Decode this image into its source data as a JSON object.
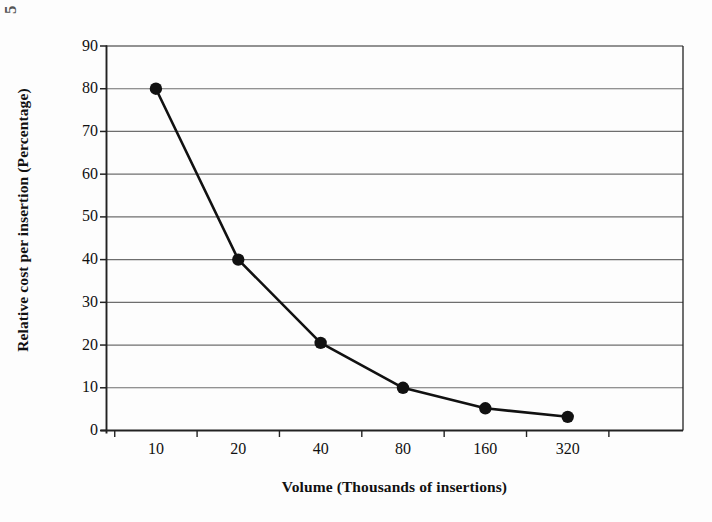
{
  "figure": {
    "background_color": "#fdfdfd",
    "line_color": "#1a1a1a",
    "marker_color": "#111111",
    "grid_color": "#6e6e6e",
    "axis_color": "#222222",
    "artifact_text": "5"
  },
  "chart_data": {
    "type": "line",
    "title": "",
    "xlabel": "Volume (Thousands of insertions)",
    "ylabel": "Relative cost per insertion (Percentage)",
    "categories": [
      "10",
      "20",
      "40",
      "80",
      "160",
      "320"
    ],
    "values": [
      80,
      40,
      20.5,
      10,
      5.2,
      3.2
    ],
    "series": [
      {
        "name": "Relative cost per insertion",
        "values": [
          80,
          40,
          20.5,
          10,
          5.2,
          3.2
        ],
        "marker": "filled-circle",
        "color": "#111111"
      }
    ],
    "ylim": [
      0,
      90
    ],
    "ytick_step": 10,
    "yticks": [
      0,
      10,
      20,
      30,
      40,
      50,
      60,
      70,
      80,
      90
    ],
    "ytick_labels": [
      "0",
      "10",
      "20",
      "30",
      "40",
      "50",
      "60",
      "70",
      "80",
      "90"
    ],
    "xtick_labels": [
      "10",
      "20",
      "40",
      "80",
      "160",
      "320"
    ],
    "grid": "horizontal",
    "legend": "none",
    "axis_type": "category"
  }
}
